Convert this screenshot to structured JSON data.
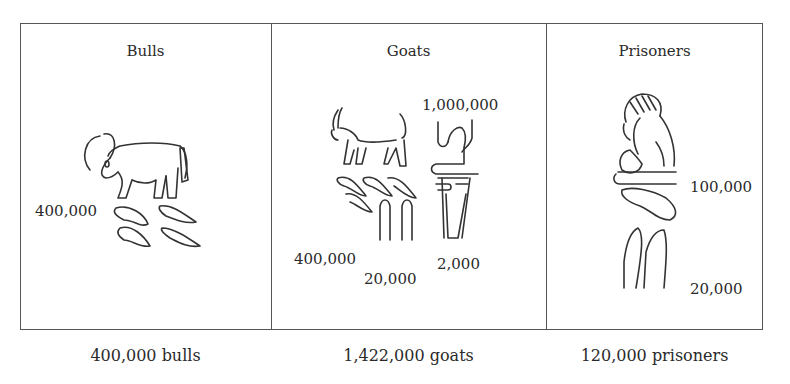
{
  "figure": {
    "panels": [
      {
        "title": "Bulls",
        "numbers": [
          "400,000"
        ],
        "caption": "400,000 bulls"
      },
      {
        "title": "Goats",
        "numbers": [
          "1,000,000",
          "400,000",
          "20,000",
          "2,000"
        ],
        "caption": "1,422,000 goats"
      },
      {
        "title": "Prisoners",
        "numbers": [
          "100,000",
          "20,000"
        ],
        "caption": "120,000 prisoners"
      }
    ]
  }
}
